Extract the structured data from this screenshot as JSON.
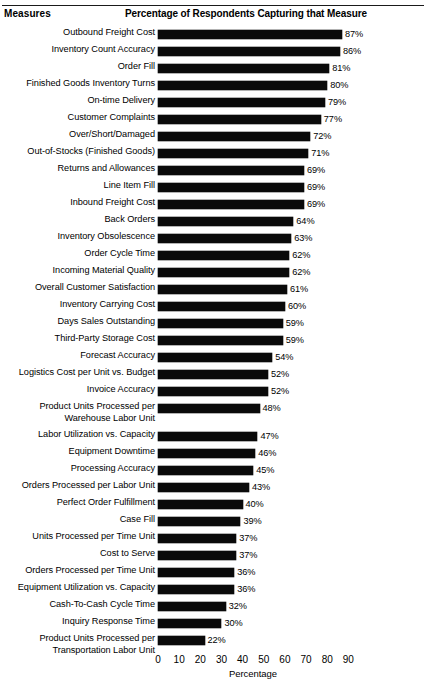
{
  "header": {
    "measures_label": "Measures",
    "percent_label": "Percentage of Respondents Capturing that Measure",
    "cut_off_title_ghost": ""
  },
  "chart_data": {
    "type": "bar",
    "orientation": "horizontal",
    "title": "Percentage of Respondents Capturing that Measure",
    "xlabel": "Percentage",
    "ylabel": "Measures",
    "xlim": [
      0,
      90
    ],
    "xticks": [
      0,
      10,
      20,
      30,
      40,
      50,
      60,
      70,
      80,
      90
    ],
    "tick_labels": [
      "0",
      "10",
      "20",
      "30",
      "40",
      "50",
      "60",
      "70",
      "80",
      "90"
    ],
    "grid": false,
    "legend": false,
    "value_suffix": "%",
    "bar_color": "#0a0a0a",
    "background_color": "#ffffff",
    "categories": [
      "Outbound Freight Cost",
      "Inventory Count Accuracy",
      "Order Fill",
      "Finished Goods Inventory Turns",
      "On-time Delivery",
      "Customer Complaints",
      "Over/Short/Damaged",
      "Out-of-Stocks (Finished Goods)",
      "Returns and Allowances",
      "Line Item Fill",
      "Inbound Freight Cost",
      "Back Orders",
      "Inventory Obsolescence",
      "Order Cycle Time",
      "Incoming Material Quality",
      "Overall Customer Satisfaction",
      "Inventory Carrying Cost",
      "Days Sales Outstanding",
      "Third-Party Storage Cost",
      "Forecast Accuracy",
      "Logistics Cost per Unit vs. Budget",
      "Invoice Accuracy",
      "Product Units Processed per Warehouse Labor Unit",
      "Labor Utilization vs. Capacity",
      "Equipment Downtime",
      "Processing Accuracy",
      "Orders Processed per Labor Unit",
      "Perfect Order Fulfillment",
      "Case Fill",
      "Units Processed per Time Unit",
      "Cost to Serve",
      "Orders Processed per Time Unit",
      "Equipment Utilization vs. Capacity",
      "Cash-To-Cash Cycle Time",
      "Inquiry Response Time",
      "Product Units Processed per Transportation Labor Unit"
    ],
    "values": [
      87,
      86,
      81,
      80,
      79,
      77,
      72,
      71,
      69,
      69,
      69,
      64,
      63,
      62,
      62,
      61,
      60,
      59,
      59,
      54,
      52,
      52,
      48,
      47,
      46,
      45,
      43,
      40,
      39,
      37,
      37,
      36,
      36,
      32,
      30,
      22
    ],
    "value_labels": [
      "87%",
      "86%",
      "81%",
      "80%",
      "79%",
      "77%",
      "72%",
      "71%",
      "69%",
      "69%",
      "69%",
      "64%",
      "63%",
      "62%",
      "62%",
      "61%",
      "60%",
      "59%",
      "59%",
      "54%",
      "52%",
      "52%",
      "48%",
      "47%",
      "46%",
      "45%",
      "43%",
      "40%",
      "39%",
      "37%",
      "37%",
      "36%",
      "36%",
      "32%",
      "30%",
      "22%"
    ]
  },
  "rows": [
    {
      "label": "Outbound Freight Cost",
      "value": 87,
      "value_label": "87%",
      "lines": 1
    },
    {
      "label": "Inventory Count Accuracy",
      "value": 86,
      "value_label": "86%",
      "lines": 1
    },
    {
      "label": "Order Fill",
      "value": 81,
      "value_label": "81%",
      "lines": 1
    },
    {
      "label": "Finished Goods Inventory Turns",
      "value": 80,
      "value_label": "80%",
      "lines": 1
    },
    {
      "label": "On-time Delivery",
      "value": 79,
      "value_label": "79%",
      "lines": 1
    },
    {
      "label": "Customer Complaints",
      "value": 77,
      "value_label": "77%",
      "lines": 1
    },
    {
      "label": "Over/Short/Damaged",
      "value": 72,
      "value_label": "72%",
      "lines": 1
    },
    {
      "label": "Out-of-Stocks (Finished Goods)",
      "value": 71,
      "value_label": "71%",
      "lines": 1
    },
    {
      "label": "Returns and Allowances",
      "value": 69,
      "value_label": "69%",
      "lines": 1
    },
    {
      "label": "Line Item Fill",
      "value": 69,
      "value_label": "69%",
      "lines": 1
    },
    {
      "label": "Inbound Freight Cost",
      "value": 69,
      "value_label": "69%",
      "lines": 1
    },
    {
      "label": "Back Orders",
      "value": 64,
      "value_label": "64%",
      "lines": 1
    },
    {
      "label": "Inventory Obsolescence",
      "value": 63,
      "value_label": "63%",
      "lines": 1
    },
    {
      "label": "Order Cycle Time",
      "value": 62,
      "value_label": "62%",
      "lines": 1
    },
    {
      "label": "Incoming Material Quality",
      "value": 62,
      "value_label": "62%",
      "lines": 1
    },
    {
      "label": "Overall Customer Satisfaction",
      "value": 61,
      "value_label": "61%",
      "lines": 1
    },
    {
      "label": "Inventory Carrying Cost",
      "value": 60,
      "value_label": "60%",
      "lines": 1
    },
    {
      "label": "Days Sales Outstanding",
      "value": 59,
      "value_label": "59%",
      "lines": 1
    },
    {
      "label": "Third-Party Storage Cost",
      "value": 59,
      "value_label": "59%",
      "lines": 1
    },
    {
      "label": "Forecast Accuracy",
      "value": 54,
      "value_label": "54%",
      "lines": 1
    },
    {
      "label": "Logistics Cost per Unit vs. Budget",
      "value": 52,
      "value_label": "52%",
      "lines": 1
    },
    {
      "label": "Invoice Accuracy",
      "value": 52,
      "value_label": "52%",
      "lines": 1
    },
    {
      "label": "Product Units Processed per Warehouse Labor Unit",
      "value": 48,
      "value_label": "48%",
      "lines": 2
    },
    {
      "label": "Labor Utilization vs. Capacity",
      "value": 47,
      "value_label": "47%",
      "lines": 1
    },
    {
      "label": "Equipment Downtime",
      "value": 46,
      "value_label": "46%",
      "lines": 1
    },
    {
      "label": "Processing Accuracy",
      "value": 45,
      "value_label": "45%",
      "lines": 1
    },
    {
      "label": "Orders Processed per Labor Unit",
      "value": 43,
      "value_label": "43%",
      "lines": 1
    },
    {
      "label": "Perfect Order Fulfillment",
      "value": 40,
      "value_label": "40%",
      "lines": 1
    },
    {
      "label": "Case Fill",
      "value": 39,
      "value_label": "39%",
      "lines": 1
    },
    {
      "label": "Units Processed per Time Unit",
      "value": 37,
      "value_label": "37%",
      "lines": 1
    },
    {
      "label": "Cost to Serve",
      "value": 37,
      "value_label": "37%",
      "lines": 1
    },
    {
      "label": "Orders Processed per Time Unit",
      "value": 36,
      "value_label": "36%",
      "lines": 1
    },
    {
      "label": "Equipment Utilization vs. Capacity",
      "value": 36,
      "value_label": "36%",
      "lines": 1
    },
    {
      "label": "Cash-To-Cash Cycle Time",
      "value": 32,
      "value_label": "32%",
      "lines": 1
    },
    {
      "label": "Inquiry Response Time",
      "value": 30,
      "value_label": "30%",
      "lines": 1
    },
    {
      "label": "Product Units Processed per Transportation Labor Unit",
      "value": 22,
      "value_label": "22%",
      "lines": 2
    }
  ],
  "axis": {
    "ticks": [
      "0",
      "10",
      "20",
      "30",
      "40",
      "50",
      "60",
      "70",
      "80",
      "90"
    ],
    "title": "Percentage"
  }
}
